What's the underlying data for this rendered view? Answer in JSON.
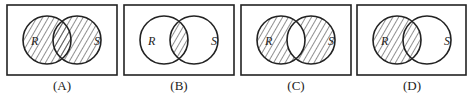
{
  "figure": {
    "set_labels": {
      "left": "R",
      "right": "S"
    },
    "stroke_color": "#222222",
    "hatch_color": "#333333",
    "panels": [
      {
        "caption": "(A)",
        "shaded_region": "R union S"
      },
      {
        "caption": "(B)",
        "shaded_region": "R intersection S"
      },
      {
        "caption": "(C)",
        "shaded_region": "R symmetric difference S"
      },
      {
        "caption": "(D)",
        "shaded_region": "R"
      }
    ]
  }
}
